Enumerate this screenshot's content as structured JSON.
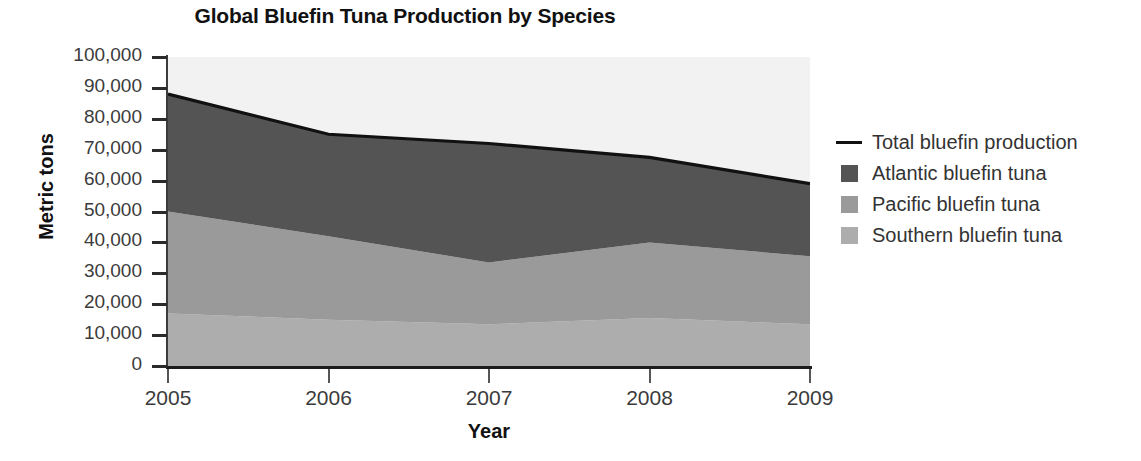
{
  "chart_data": {
    "type": "area",
    "title": "Global Bluefin Tuna Production by Species",
    "xlabel": "Year",
    "ylabel": "Metric tons",
    "x": [
      2005,
      2006,
      2007,
      2008,
      2009
    ],
    "categories": [
      "2005",
      "2006",
      "2007",
      "2008",
      "2009"
    ],
    "xtick_labels": [
      "2005",
      "2006",
      "2007",
      "2008",
      "2009"
    ],
    "ytick_labels": [
      "100,000",
      "90,000",
      "80,000",
      "70,000",
      "60,000",
      "50,000",
      "40,000",
      "30,000",
      "20,000",
      "10,000",
      "0"
    ],
    "ytick_values": [
      100000,
      90000,
      80000,
      70000,
      60000,
      50000,
      40000,
      30000,
      20000,
      10000,
      0
    ],
    "ylim": [
      0,
      100000
    ],
    "xlim": [
      2005,
      2009
    ],
    "grid": false,
    "stacked": true,
    "legend_position": "right",
    "series": [
      {
        "name": "Southern bluefin tuna",
        "color": "#adadad",
        "values": [
          17000,
          15000,
          13500,
          15500,
          13500
        ]
      },
      {
        "name": "Pacific bluefin tuna",
        "color": "#9a9a9a",
        "values": [
          33000,
          27000,
          20000,
          24500,
          22000
        ]
      },
      {
        "name": "Atlantic bluefin tuna",
        "color": "#545454",
        "values": [
          38000,
          33000,
          38500,
          27500,
          23500
        ]
      }
    ],
    "line_series": {
      "name": "Total bluefin production",
      "color": "#111111",
      "values": [
        88000,
        75000,
        72000,
        67500,
        59000
      ]
    },
    "plot_background": "#f2f2f2"
  },
  "legend": {
    "items": [
      {
        "label": "Total bluefin production",
        "marker": "line",
        "color": "#111111"
      },
      {
        "label": "Atlantic bluefin tuna",
        "marker": "swatch",
        "color": "#545454"
      },
      {
        "label": "Pacific bluefin tuna",
        "marker": "swatch",
        "color": "#9a9a9a"
      },
      {
        "label": "Southern bluefin tuna",
        "marker": "swatch",
        "color": "#adadad"
      }
    ]
  }
}
